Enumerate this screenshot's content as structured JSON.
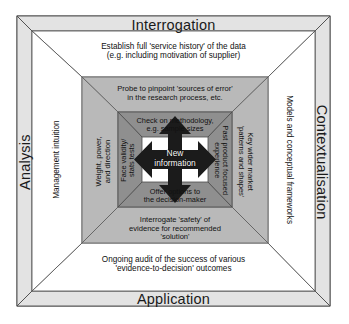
{
  "diagram": {
    "title_bands": {
      "top": "Interrogation",
      "bottom": "Application",
      "left": "Analysis",
      "right": "Contextualisation"
    },
    "ring_outer": {
      "top": "Establish full 'service history' of the data\n(e.g. including motivation of supplier)",
      "bottom": "Ongoing audit of the success of various\n'evidence-to-decision' outcomes",
      "left": "Management intuition",
      "right": "Models and conceptual frameworks"
    },
    "ring_middle": {
      "top": "Probe to pinpoint 'sources of error'\nin the research process, etc.",
      "bottom": "Interrogate 'safety' of\nevidence for recommended\n'solution'",
      "left": "Weight, power,\nand direction",
      "right": "Key wider market\n'patterns and shapes'"
    },
    "ring_inner": {
      "top": "Check on methodology,\ne.g. sample sizes",
      "bottom": "Offer options to\nthe decision-maker",
      "left": "Face validity/\nstats tests",
      "right": "Past product focused\nexperience"
    },
    "center": {
      "label": "New\ninformation",
      "icon": "four-way-arrow-icon"
    },
    "colors": {
      "band_fill": "#e3e3e3",
      "ring_outer_fill": "#ffffff",
      "ring_middle_fill": "#b9b9b9",
      "ring_inner_fill": "#8f8f8f",
      "center_arrow": "#1b1b1b",
      "stroke": "#4a4a4a",
      "text": "#111111"
    }
  }
}
